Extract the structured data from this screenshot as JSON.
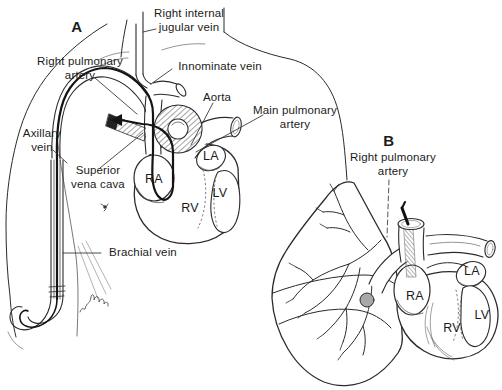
{
  "figure": {
    "ink_color": "#2b2b2b",
    "balloon_color": "#a8a8a8",
    "background_color": "#ffffff"
  },
  "panel_a": {
    "panel_label": "A",
    "labels": {
      "right_internal_jugular": "Right internal\njugular vein",
      "right_pulmonary_artery": "Right pulmonary\nartery",
      "innominate_vein": "Innominate vein",
      "aorta": "Aorta",
      "main_pulmonary_artery": "Main pulmonary\nartery",
      "axillary_vein": "Axillary\nvein",
      "superior_vena_cava": "Superior\nvena cava",
      "brachial_vein": "Brachial vein",
      "ra": "RA",
      "la": "LA",
      "rv": "RV",
      "lv": "LV"
    }
  },
  "panel_b": {
    "panel_label": "B",
    "labels": {
      "right_pulmonary_artery": "Right pulmonary\nartery",
      "ra": "RA",
      "la": "LA",
      "rv": "RV",
      "lv": "LV"
    }
  }
}
